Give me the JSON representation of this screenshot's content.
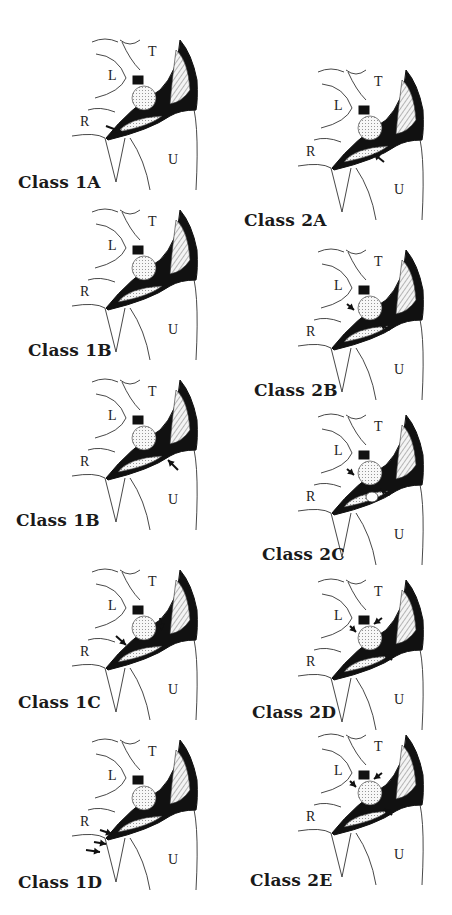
{
  "figure": {
    "bone_labels": {
      "lunate": "L",
      "triquetrum": "T",
      "radius": "R",
      "ulna": "U"
    },
    "panels": [
      {
        "id": "1A",
        "caption": "Class  1A",
        "column": "left",
        "arrows": 1,
        "variant": "1A"
      },
      {
        "id": "1B-a",
        "caption": "Class  1B",
        "column": "left",
        "arrows": 0,
        "variant": "1B"
      },
      {
        "id": "1B-b",
        "caption": "Class  1B",
        "column": "left",
        "arrows": 1,
        "variant": "1Bb"
      },
      {
        "id": "1C",
        "caption": "Class  1C",
        "column": "left",
        "arrows": 2,
        "variant": "1C"
      },
      {
        "id": "1D",
        "caption": "Class  1D",
        "column": "left",
        "arrows": 3,
        "variant": "1D"
      },
      {
        "id": "2A",
        "caption": "Class  2A",
        "column": "right",
        "arrows": 1,
        "variant": "2A"
      },
      {
        "id": "2B",
        "caption": "Class  2B",
        "column": "right",
        "arrows": 2,
        "variant": "2B"
      },
      {
        "id": "2C",
        "caption": "Class  2C",
        "column": "right",
        "arrows": 2,
        "variant": "2C"
      },
      {
        "id": "2D",
        "caption": "Class  2D",
        "column": "right",
        "arrows": 3,
        "variant": "2D"
      },
      {
        "id": "2E",
        "caption": "Class  2E",
        "column": "right",
        "arrows": 3,
        "variant": "2E"
      }
    ]
  }
}
